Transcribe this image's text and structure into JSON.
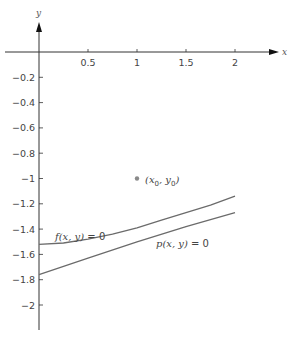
{
  "chart_data": {
    "type": "line",
    "title": "",
    "xlabel": "x",
    "ylabel": "y",
    "xlim": [
      -0.3,
      2.4
    ],
    "ylim": [
      -2.2,
      0.35
    ],
    "grid": false,
    "legend": "none",
    "x_ticks": [
      0.5,
      1,
      1.5,
      2
    ],
    "x_tick_labels": [
      "0.5",
      "1",
      "1.5",
      "2"
    ],
    "y_ticks": [
      -0.2,
      -0.4,
      -0.6,
      -0.8,
      -1,
      -1.2,
      -1.4,
      -1.6,
      -1.8,
      -2
    ],
    "y_tick_labels": [
      "-0.2",
      "-0.4",
      "-0.6",
      "-0.8",
      "-1",
      "-1.2",
      "-1.4",
      "-1.6",
      "-1.8",
      "-2"
    ],
    "series": [
      {
        "name": "f(x, y) = 0",
        "x": [
          0,
          0.25,
          0.5,
          0.75,
          1,
          1.25,
          1.5,
          1.75,
          2
        ],
        "y": [
          -1.52,
          -1.51,
          -1.48,
          -1.44,
          -1.39,
          -1.33,
          -1.27,
          -1.21,
          -1.14
        ]
      },
      {
        "name": "p(x, y) = 0",
        "x": [
          0,
          0.5,
          1,
          1.5,
          2
        ],
        "y": [
          -1.76,
          -1.63,
          -1.5,
          -1.38,
          -1.27
        ]
      }
    ],
    "points": [
      {
        "label": "(x0, y0)",
        "x": 1,
        "y": -1
      }
    ],
    "annotations": [
      {
        "text": "f(x, y) = 0",
        "x": 0.05,
        "y": -1.44
      },
      {
        "text": "p(x, y) = 0",
        "x": 1.1,
        "y": -1.59
      },
      {
        "text": "(x0, y0)",
        "x": 1.08,
        "y": -1.0
      }
    ]
  },
  "labels": {
    "x_axis": "x",
    "y_axis": "y",
    "f_label": {
      "fn": "f",
      "args": "(x, y)",
      "eq": " = 0"
    },
    "p_label": {
      "fn": "p",
      "args": "(x, y)",
      "eq": " = 0"
    },
    "point_label": {
      "open": "(x",
      "sub1": "0",
      "mid": ", y",
      "sub2": "0",
      "close": ")"
    }
  },
  "colors": {
    "axis": "#333333",
    "curve": "#6b6b6b",
    "point": "#8a8a8a",
    "text": "#444444"
  }
}
